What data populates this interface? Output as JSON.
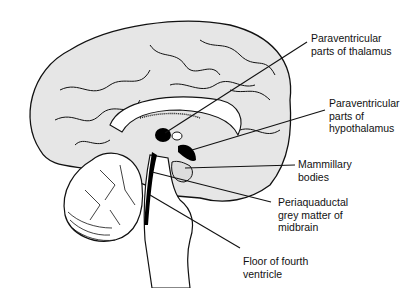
{
  "figure": {
    "labels": [
      {
        "id": "paraventricular-thalamus",
        "lines": [
          "Paraventricular",
          "parts of thalamus"
        ]
      },
      {
        "id": "paraventricular-hypothalamus",
        "lines": [
          "Paraventricular",
          "parts of",
          "hypothalamus"
        ]
      },
      {
        "id": "mammillary-bodies",
        "lines": [
          "Mammillary",
          "bodies"
        ]
      },
      {
        "id": "periaqueductal-grey",
        "lines": [
          "Periaquaductal",
          "grey matter of",
          "midbrain"
        ]
      },
      {
        "id": "floor-fourth-ventricle",
        "lines": [
          "Floor of fourth",
          "ventricle"
        ]
      }
    ],
    "colors": {
      "line": "#111111",
      "cortex_fill": "#e6e6e6",
      "highlight": "#000000",
      "background": "#ffffff"
    }
  }
}
